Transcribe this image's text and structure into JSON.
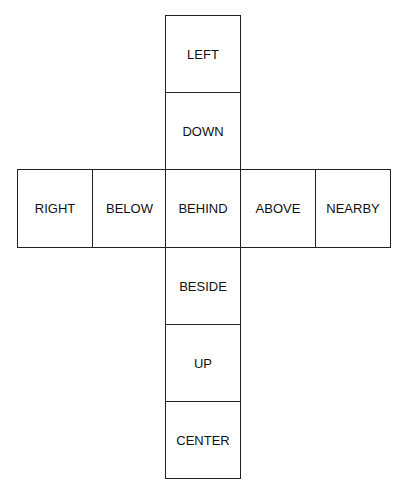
{
  "diagram": {
    "type": "cube-net",
    "column_top": [
      "LEFT",
      "DOWN"
    ],
    "row": [
      "RIGHT",
      "BELOW",
      "BEHIND",
      "ABOVE",
      "NEARBY"
    ],
    "column_bottom": [
      "BESIDE",
      "UP",
      "CENTER"
    ]
  }
}
